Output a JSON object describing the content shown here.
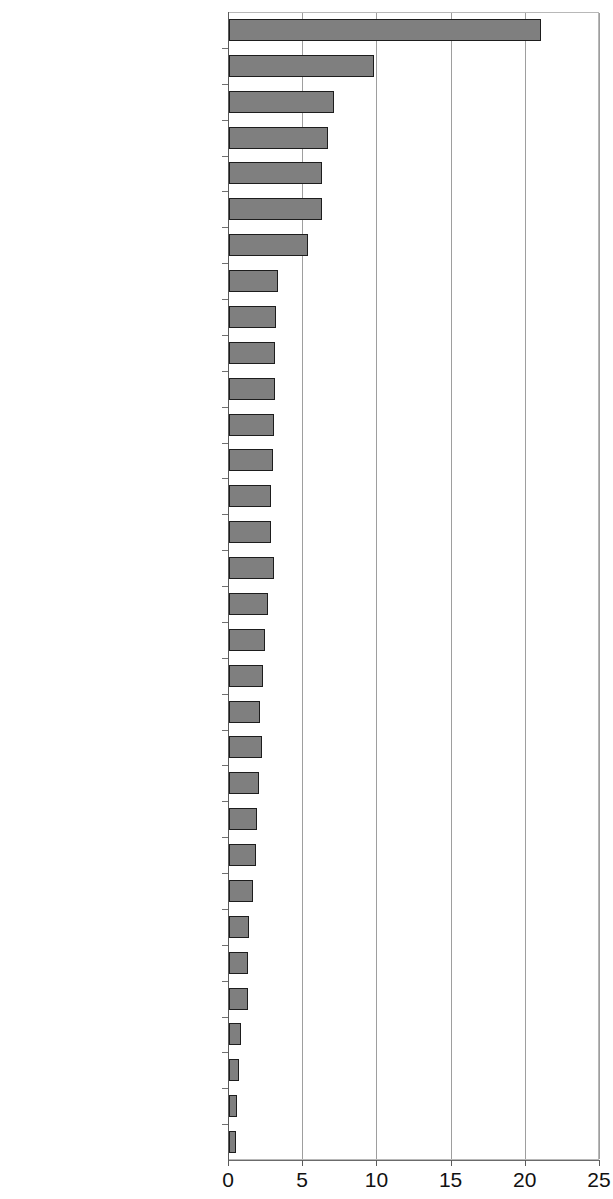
{
  "top_fragment_text": "",
  "chart_data": {
    "type": "bar",
    "orientation": "horizontal",
    "title": "",
    "subtitle": "",
    "xlabel": "",
    "ylabel": "",
    "xlim": [
      0,
      25
    ],
    "xticks": [
      0,
      5,
      10,
      15,
      20,
      25
    ],
    "xtick_labels": [
      "0",
      "5",
      "10",
      "15",
      "20",
      "25"
    ],
    "grid": "vertical",
    "legend": "none",
    "bar_fill_color": "#7f7f7f",
    "bar_border_color": "#1d1d1d",
    "gridline_color": "#9e9e9e",
    "categories": [
      "Fife",
      "Edinburgh",
      "Highlands",
      "Scottish Borders",
      "Glasgow",
      "Dumfries and Galloway",
      "Argyle and Bute",
      "Aberdeen City",
      "Aberdeenshire",
      "Orkney",
      "Falkirk",
      "East Ayrshire",
      "West Lothian",
      "South Ayrshire",
      "Angus",
      "Clackmannanshire",
      "Moray",
      "West Dunbartonshire",
      "Stirling",
      "Perth and Kinross",
      "North Lanarkshire",
      "North Ayrshire",
      "Midlothian",
      "Dundee City",
      "East Lothian",
      "South Lanarkshire",
      "Renfrewshire",
      "East Dumbartonshire",
      "East Renfrewshire",
      "Eilean Siar",
      "Shetlands",
      "Inverclyde"
    ],
    "values": [
      21.0,
      9.8,
      7.1,
      6.7,
      6.3,
      6.3,
      5.3,
      3.3,
      3.2,
      3.1,
      3.1,
      3.0,
      2.95,
      2.8,
      2.8,
      3.0,
      2.6,
      2.45,
      2.3,
      2.1,
      2.2,
      2.0,
      1.9,
      1.85,
      1.65,
      1.35,
      1.25,
      1.25,
      0.8,
      0.7,
      0.55,
      0.5
    ]
  }
}
